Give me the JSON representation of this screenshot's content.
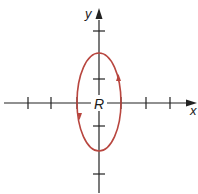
{
  "diagram": {
    "type": "coordinate-plane-ellipse",
    "axes": {
      "x_label": "x",
      "y_label": "y",
      "color": "#222222",
      "x_tick_count_each_side": 3,
      "y_tick_count_each_side": 2
    },
    "origin_label": "R",
    "curve": {
      "shape": "ellipse",
      "orientation": "vertical",
      "semi_axis_x_ticks": 1,
      "semi_axis_y_ticks": 2,
      "color": "#b8463f",
      "direction": "counterclockwise",
      "direction_markers": [
        "right-side-up",
        "left-side-down"
      ]
    }
  }
}
